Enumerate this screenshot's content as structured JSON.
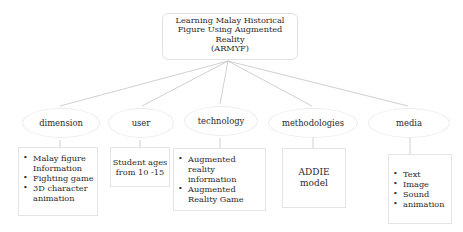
{
  "root": {
    "lines": [
      "Learning Malay Historical",
      "Figure Using Augmented",
      "Reality",
      "(ARMYF)"
    ]
  },
  "categories": [
    {
      "label": "dimension",
      "items": [
        "Malay figure Information",
        "Fighting game",
        "3D character animation"
      ]
    },
    {
      "label": "user",
      "text": [
        "Student ages",
        "from 10 -15"
      ]
    },
    {
      "label": "technology",
      "items": [
        "Augmented reality information",
        "Augmented Reality Game"
      ]
    },
    {
      "label": "methodologies",
      "text": [
        "ADDIE",
        "model"
      ]
    },
    {
      "label": "media",
      "items": [
        "Text",
        "Image",
        "Sound",
        "animation"
      ]
    }
  ],
  "colors": {
    "line": "#bdbdbd",
    "border": "#e4e4e4",
    "text": "#2a2a2a"
  }
}
